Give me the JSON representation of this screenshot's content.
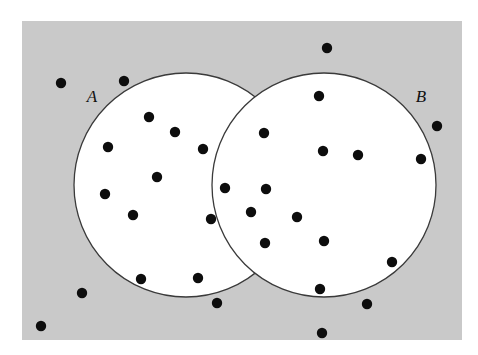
{
  "figure": {
    "name": "venn-diagram-two-sets-with-sample-points",
    "canvas": {
      "width": 478,
      "height": 355,
      "background": "#ffffff"
    },
    "universe": {
      "name": "universal-set-rectangle",
      "x": 22,
      "y": 21,
      "width": 440,
      "height": 319,
      "fill": "#c9c9c9",
      "stroke": "none"
    },
    "sets": [
      {
        "id": "A",
        "label": "A",
        "label_x": 92,
        "label_y": 102,
        "cx": 186,
        "cy": 185,
        "r": 112,
        "fill": "#ffffff",
        "stroke": "#3a3a3a",
        "stroke_width": 1.3
      },
      {
        "id": "B",
        "label": "B",
        "label_x": 421,
        "label_y": 102,
        "cx": 324,
        "cy": 185,
        "r": 112,
        "fill": "#ffffff",
        "stroke": "#3a3a3a",
        "stroke_width": 1.3
      }
    ],
    "point_style": {
      "radius": 5.2,
      "fill": "#0d0d0d"
    },
    "label_font_size": 17
  },
  "chart_data": {
    "type": "scatter",
    "title": "",
    "xlabel": "",
    "ylabel": "",
    "xlim": [
      0,
      478
    ],
    "ylim": [
      0,
      355
    ],
    "grid": false,
    "legend": false,
    "annotations": [
      "A",
      "B"
    ],
    "regions": {
      "only_A": 12,
      "only_B": 8,
      "A_and_B": 5,
      "outside": 9,
      "total": 34
    },
    "series": [
      {
        "name": "A only",
        "region": "only_A",
        "points": [
          [
            149,
            117
          ],
          [
            175,
            132
          ],
          [
            108,
            147
          ],
          [
            203,
            149
          ],
          [
            157,
            177
          ],
          [
            105,
            194
          ],
          [
            133,
            215
          ],
          [
            211,
            219
          ],
          [
            141,
            279
          ],
          [
            198,
            278
          ],
          [
            124,
            81
          ],
          [
            217,
            303
          ]
        ]
      },
      {
        "name": "A intersect B",
        "region": "A_and_B",
        "points": [
          [
            264,
            133
          ],
          [
            225,
            188
          ],
          [
            266,
            189
          ],
          [
            251,
            212
          ],
          [
            265,
            243
          ]
        ]
      },
      {
        "name": "B only",
        "region": "only_B",
        "points": [
          [
            319,
            96
          ],
          [
            323,
            151
          ],
          [
            358,
            155
          ],
          [
            421,
            159
          ],
          [
            297,
            217
          ],
          [
            324,
            241
          ],
          [
            392,
            262
          ],
          [
            320,
            289
          ]
        ]
      },
      {
        "name": "Outside A and B",
        "region": "outside",
        "points": [
          [
            61,
            83
          ],
          [
            327,
            48
          ],
          [
            437,
            126
          ],
          [
            82,
            293
          ],
          [
            41,
            326
          ],
          [
            367,
            304
          ],
          [
            322,
            333
          ]
        ]
      }
    ]
  }
}
